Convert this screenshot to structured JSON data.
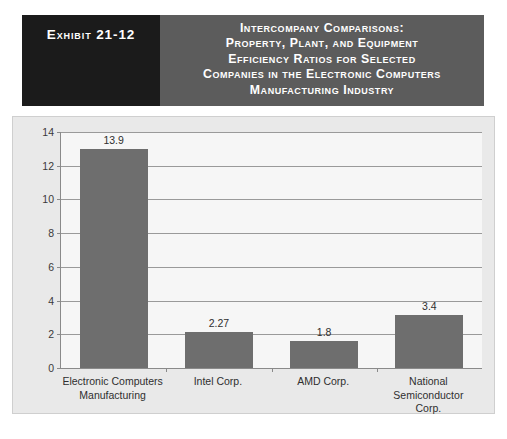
{
  "exhibit": {
    "number_label": "Exhibit 21-12",
    "title_lines": [
      "Intercompany Comparisons:",
      "Property, Plant, and Equipment",
      "Efficiency Ratios for Selected",
      "Companies in the Electronic Computers",
      "Manufacturing Industry"
    ]
  },
  "colors": {
    "exhibit_number_bg": "#1b1b1b",
    "exhibit_title_bg": "#5c5c5c",
    "panel_bg": "#e9e9e9",
    "plot_bg": "#f6f6f6",
    "bar_fill": "#6e6e6e",
    "gridline": "#9a9a9a",
    "axis": "#8a8a8a"
  },
  "chart_data": {
    "type": "bar",
    "title": "Intercompany Comparisons: Property, Plant, and Equipment Efficiency Ratios for Selected Companies in the Electronic Computers Manufacturing Industry",
    "xlabel": "",
    "ylabel": "",
    "ylim": [
      0,
      14
    ],
    "yticks": [
      0,
      2,
      4,
      6,
      8,
      10,
      12,
      14
    ],
    "ytick_labels": [
      "0",
      "2",
      "4",
      "6",
      "8",
      "10",
      "12",
      "14"
    ],
    "grid": true,
    "legend": false,
    "categories": [
      "Electronic Computers Manufacturing",
      "Intel Corp.",
      "AMD Corp.",
      "National Semiconductor Corp."
    ],
    "category_label_lines": [
      [
        "Electronic Computers",
        "Manufacturing"
      ],
      [
        "Intel Corp."
      ],
      [
        "AMD Corp."
      ],
      [
        "National Semiconductor",
        "Corp."
      ]
    ],
    "values": [
      13.9,
      2.27,
      1.8,
      3.4
    ],
    "value_labels": [
      "13.9",
      "2.27",
      "1.8",
      "3.4"
    ],
    "bar_plotted_heights": [
      13.0,
      2.15,
      1.6,
      3.15
    ]
  }
}
